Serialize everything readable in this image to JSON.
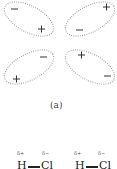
{
  "figure": {
    "caption": "(a)",
    "colors": {
      "outline": "#9a9a9a",
      "charge": "#333333"
    },
    "ellipses": [
      {
        "name": "top-left",
        "cx": 29,
        "cy": 19,
        "rx": 27,
        "ry": 13,
        "rotate": 28,
        "charges": [
          {
            "sign": "−",
            "x": 12,
            "y": 12
          },
          {
            "sign": "+",
            "x": 39,
            "y": 32
          }
        ]
      },
      {
        "name": "top-right",
        "cx": 92,
        "cy": 19,
        "rx": 27,
        "ry": 13,
        "rotate": -28,
        "charges": [
          {
            "sign": "+",
            "x": 104,
            "y": 10
          },
          {
            "sign": "−",
            "x": 76,
            "y": 33
          }
        ]
      },
      {
        "name": "bottom-left",
        "cx": 29,
        "cy": 67,
        "rx": 27,
        "ry": 13,
        "rotate": -28,
        "charges": [
          {
            "sign": "−",
            "x": 40,
            "y": 60
          },
          {
            "sign": "+",
            "x": 13,
            "y": 82
          }
        ]
      },
      {
        "name": "bottom-right",
        "cx": 92,
        "cy": 67,
        "rx": 27,
        "ry": 13,
        "rotate": 28,
        "charges": [
          {
            "sign": "+",
            "x": 78,
            "y": 58
          },
          {
            "sign": "−",
            "x": 104,
            "y": 79
          }
        ]
      }
    ]
  },
  "molecules": [
    {
      "delta_pos": "δ+",
      "delta_neg": "δ−",
      "left_atom": "H",
      "bond": "—",
      "right_atom": "Cl"
    },
    {
      "delta_pos": "δ+",
      "delta_neg": "δ−",
      "left_atom": "H",
      "bond": "—",
      "right_atom": "Cl"
    }
  ]
}
